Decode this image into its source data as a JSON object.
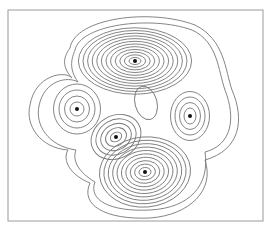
{
  "diagram": {
    "type": "contour-map",
    "frame": {
      "x": 8,
      "y": 10,
      "width": 255,
      "height": 211,
      "stroke": "#9a9a9a"
    },
    "line_color": "#777777",
    "dot_color": "#111111",
    "centers": [
      {
        "id": "top",
        "x": 135,
        "y": 61,
        "rings": 12,
        "rx0": 6,
        "ry0": 3.5,
        "drx": 4.6,
        "dry": 2.7,
        "rot": 0
      },
      {
        "id": "left",
        "x": 77,
        "y": 109,
        "rings": 4,
        "rx0": 7,
        "ry0": 7,
        "drx": 5.5,
        "dry": 6,
        "rot": 0
      },
      {
        "id": "right",
        "x": 190,
        "y": 116,
        "rings": 4,
        "rx0": 6,
        "ry0": 8,
        "drx": 4.5,
        "dry": 5.5,
        "rot": 0
      },
      {
        "id": "center",
        "x": 116,
        "y": 137,
        "rings": 5,
        "rx0": 6,
        "ry0": 4.5,
        "drx": 5,
        "dry": 4.2,
        "rot": -30
      },
      {
        "id": "bottom",
        "x": 145,
        "y": 172,
        "rings": 10,
        "rx0": 6,
        "ry0": 4.5,
        "drx": 4.4,
        "dry": 3.4,
        "rot": -5
      }
    ],
    "envelopes": [
      "M70,48 C75,18 150,8 195,25 C225,40 225,70 232,90 C245,120 240,150 205,160 C215,190 190,215 150,218 C105,220 80,205 90,183 C70,175 62,160 68,150 C40,148 25,125 30,105 C35,75 65,70 72,78 C60,65 65,55 70,48 Z",
      "M75,50 C80,25 150,15 192,30 C218,42 218,70 225,90 C236,118 232,145 205,152 C210,185 190,208 150,210 C110,212 88,200 95,182 C78,172 72,160 76,150 C48,146 35,125 39,106 C44,80 68,76 78,82 C68,68 72,58 75,50 Z"
    ],
    "hole": {
      "x": 146,
      "y": 103,
      "rx": 11,
      "ry": 17,
      "rot": -15
    }
  }
}
